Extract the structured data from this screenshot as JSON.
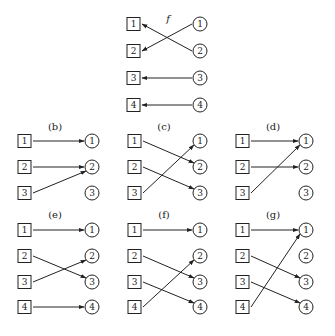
{
  "figure": {
    "panels": [
      {
        "id": "f",
        "label": "f",
        "italic": true,
        "sq_x": 127,
        "ci_x": 200,
        "label_x": 168,
        "label_y": 22,
        "rows_y": [
          24,
          51,
          78,
          105
        ],
        "domain": [
          "1",
          "2",
          "3",
          "4"
        ],
        "codomain": [
          "1",
          "2",
          "3",
          "4"
        ],
        "direction": "circle-to-square",
        "mappings": [
          [
            1,
            2
          ],
          [
            2,
            1
          ],
          [
            3,
            3
          ],
          [
            4,
            4
          ]
        ]
      },
      {
        "id": "b",
        "label": "(b)",
        "sq_x": 18,
        "ci_x": 92,
        "label_x": 55,
        "label_y": 130,
        "rows_y": [
          141,
          167,
          193
        ],
        "domain": [
          "1",
          "2",
          "3"
        ],
        "codomain": [
          "1",
          "2",
          "3"
        ],
        "direction": "square-to-circle",
        "mappings": [
          [
            1,
            1
          ],
          [
            2,
            2
          ],
          [
            3,
            2
          ]
        ]
      },
      {
        "id": "c",
        "label": "(c)",
        "sq_x": 128,
        "ci_x": 200,
        "label_x": 164,
        "label_y": 130,
        "rows_y": [
          141,
          167,
          193
        ],
        "domain": [
          "1",
          "2",
          "3"
        ],
        "codomain": [
          "1",
          "2",
          "3"
        ],
        "direction": "square-to-circle",
        "mappings": [
          [
            1,
            2
          ],
          [
            2,
            3
          ],
          [
            3,
            1
          ]
        ]
      },
      {
        "id": "d",
        "label": "(d)",
        "sq_x": 236,
        "ci_x": 306,
        "label_x": 273,
        "label_y": 130,
        "rows_y": [
          141,
          167,
          193
        ],
        "domain": [
          "1",
          "2",
          "3"
        ],
        "codomain": [
          "1",
          "2",
          "3"
        ],
        "direction": "square-to-circle",
        "mappings": [
          [
            1,
            1
          ],
          [
            2,
            2
          ],
          [
            3,
            1
          ]
        ]
      },
      {
        "id": "e",
        "label": "(e)",
        "sq_x": 18,
        "ci_x": 92,
        "label_x": 55,
        "label_y": 218,
        "rows_y": [
          230,
          256,
          282,
          307
        ],
        "domain": [
          "1",
          "2",
          "3",
          "4"
        ],
        "codomain": [
          "1",
          "2",
          "3",
          "4"
        ],
        "direction": "square-to-circle",
        "mappings": [
          [
            1,
            1
          ],
          [
            2,
            3
          ],
          [
            3,
            2
          ],
          [
            4,
            4
          ]
        ]
      },
      {
        "id": "f2",
        "label": "(f)",
        "sq_x": 128,
        "ci_x": 200,
        "label_x": 164,
        "label_y": 218,
        "rows_y": [
          230,
          256,
          282,
          307
        ],
        "domain": [
          "1",
          "2",
          "3",
          "4"
        ],
        "codomain": [
          "1",
          "2",
          "3",
          "4"
        ],
        "direction": "square-to-circle",
        "mappings": [
          [
            1,
            1
          ],
          [
            2,
            3
          ],
          [
            3,
            4
          ],
          [
            4,
            2
          ]
        ]
      },
      {
        "id": "g",
        "label": "(g)",
        "sq_x": 236,
        "ci_x": 306,
        "label_x": 273,
        "label_y": 218,
        "rows_y": [
          230,
          256,
          282,
          307
        ],
        "domain": [
          "1",
          "2",
          "3",
          "4"
        ],
        "codomain": [
          "1",
          "2",
          "3",
          "4"
        ],
        "direction": "square-to-circle",
        "mappings": [
          [
            1,
            1
          ],
          [
            2,
            3
          ],
          [
            3,
            4
          ],
          [
            4,
            1
          ]
        ]
      }
    ]
  }
}
